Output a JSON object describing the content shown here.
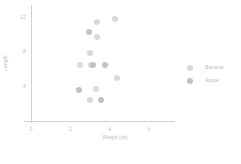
{
  "chart_data": {
    "type": "scatter",
    "title": "",
    "xlabel": "Weight (oz)",
    "ylabel": "Length",
    "xlim": [
      0,
      7
    ],
    "ylim": [
      0,
      13
    ],
    "grid": false,
    "legend_position": "right",
    "xticks": [
      "0",
      "2",
      "4",
      "6"
    ],
    "xtick_values": [
      0,
      2,
      4,
      6
    ],
    "yticks": [
      "4",
      "8",
      "12"
    ],
    "ytick_values": [
      4,
      8,
      12
    ],
    "series": [
      {
        "name": "Banana",
        "color": "#d9d9d9",
        "points": [
          {
            "x": 3.35,
            "y": 11.4
          },
          {
            "x": 4.25,
            "y": 11.7
          },
          {
            "x": 3.35,
            "y": 9.7
          },
          {
            "x": 3.0,
            "y": 7.8
          },
          {
            "x": 2.5,
            "y": 6.4
          },
          {
            "x": 3.05,
            "y": 6.5
          },
          {
            "x": 4.35,
            "y": 4.9
          },
          {
            "x": 3.3,
            "y": 3.7
          },
          {
            "x": 3.0,
            "y": 2.4
          }
        ]
      },
      {
        "name": "Apple",
        "color": "#c2c2c2",
        "points": [
          {
            "x": 2.95,
            "y": 10.2
          },
          {
            "x": 3.15,
            "y": 6.5
          },
          {
            "x": 3.75,
            "y": 6.5
          },
          {
            "x": 2.45,
            "y": 3.6
          },
          {
            "x": 3.55,
            "y": 2.4
          }
        ]
      }
    ]
  },
  "legend": {
    "items": [
      {
        "label": "Banana",
        "color": "#d9d9d9"
      },
      {
        "label": "Apple",
        "color": "#c2c2c2"
      }
    ]
  },
  "axes": {
    "x_title": "Weight (oz)",
    "y_title": "Length"
  }
}
